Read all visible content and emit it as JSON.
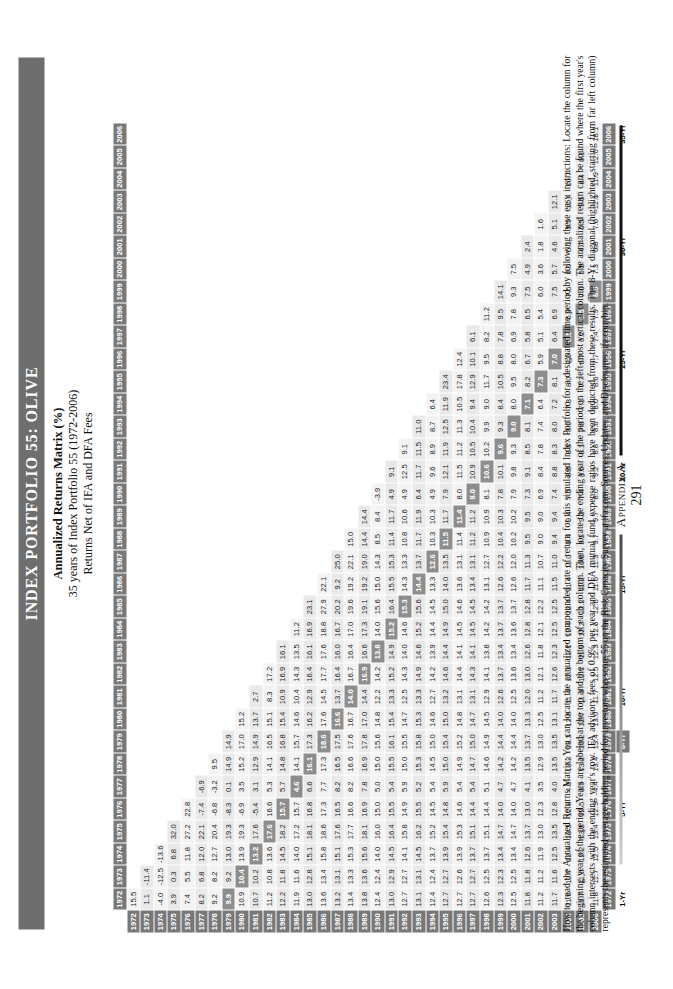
{
  "page": {
    "title": "Index Portfolio 55: Olive",
    "subtitle_1": "Annualized Returns Matrix (%)",
    "subtitle_2": "35 years of Index Portfolio 55 (1972-2006)",
    "subtitle_3": "Returns Net of IFA and DFA Fees",
    "appendix_label": "Appendix A",
    "page_number": "291",
    "caption": "How to read the Annualized Returns Matrix: You can locate the annualized compounded rate of return for this simulated Index Portfolio for a designated time period by following these easy instructions: Locate the column for the beginning year of the period. Years are labeled at the top and the bottom of each column. Then, locate the ending year of the period on the left-most vertical column. The annualized return can be found where the first year's column intersects with the ending year's row. IFA advisory fees of 0.9% per year and DFA mutual fund expense ratios have been deducted from these results. The 8-Yr diagonal (highlighted, starting from far left column) represents the estimated average holding period for investors who score 55 on the Risk Capacity Survey at ifa.com. Sources, Updates, and Disclosures: ifa.com/bip.",
    "colors": {
      "band": "#6e6e6e",
      "header": "#787878",
      "diagonal": "#8d8d8d",
      "cell": "#f3f3f3"
    }
  },
  "chart_data": {
    "type": "table",
    "title": "Annualized Returns Matrix (%)",
    "xlabel": "Beginning Year",
    "ylabel": "Ending Year",
    "columns": [
      "1972",
      "1973",
      "1974",
      "1975",
      "1976",
      "1977",
      "1978",
      "1979",
      "1980",
      "1981",
      "1982",
      "1983",
      "1984",
      "1985",
      "1986",
      "1987",
      "1988",
      "1989",
      "1990",
      "1991",
      "1992",
      "1993",
      "1994",
      "1995",
      "1996",
      "1997",
      "1998",
      "1999",
      "2000",
      "2001",
      "2002",
      "2003",
      "2004",
      "2005",
      "2006"
    ],
    "row_labels": [
      "1972",
      "1973",
      "1974",
      "1975",
      "1976",
      "1977",
      "1978",
      "1979",
      "1980",
      "1981",
      "1982",
      "1983",
      "1984",
      "1985",
      "1986",
      "1987",
      "1988",
      "1989",
      "1990",
      "1991",
      "1992",
      "1993",
      "1994",
      "1995",
      "1996",
      "1997",
      "1998",
      "1999",
      "2000",
      "2001",
      "2002",
      "2003",
      "2004",
      "2005",
      "2006"
    ],
    "period_markers": [
      {
        "row": "1972",
        "label": "1-Yr",
        "highlight": false
      },
      {
        "row": "1976",
        "label": "5-Yr",
        "highlight": false
      },
      {
        "row": "1979",
        "label": "8-Yr",
        "highlight": true
      },
      {
        "row": "1981",
        "label": "10-Yr",
        "highlight": false
      },
      {
        "row": "1986",
        "label": "15-Yr",
        "highlight": false
      },
      {
        "row": "1991",
        "label": "20-Yr",
        "highlight": false
      },
      {
        "row": "1996",
        "label": "25-Yr",
        "highlight": false
      },
      {
        "row": "2001",
        "label": "30-Yr",
        "highlight": false
      },
      {
        "row": "2006",
        "label": "35-Yr",
        "highlight": false
      }
    ],
    "diagonal_offset": 7,
    "rows": [
      [
        "15.5"
      ],
      [
        "1.1",
        "-11.4"
      ],
      [
        "-4.0",
        "-12.5",
        "-13.6"
      ],
      [
        "3.9",
        "0.3",
        "6.8",
        "32.0"
      ],
      [
        "7.4",
        "5.5",
        "11.8",
        "27.2",
        "22.8"
      ],
      [
        "8.2",
        "6.8",
        "12.0",
        "22.1",
        "-7.4",
        "-6.9"
      ],
      [
        "9.2",
        "8.2",
        "12.7",
        "20.4",
        "-6.8",
        "-3.2",
        "9.5"
      ],
      [
        "9.9",
        "9.2",
        "13.0",
        "19.3",
        "-8.3",
        "0.1",
        "14.9",
        "14.9"
      ],
      [
        "10.9",
        "10.4",
        "13.9",
        "19.3",
        "-6.9",
        "3.5",
        "15.2",
        "17.0",
        "15.2"
      ],
      [
        "10.7",
        "10.2",
        "13.2",
        "17.6",
        "-5.4",
        "3.1",
        "12.9",
        "14.9",
        "13.7",
        "2.7"
      ],
      [
        "11.2",
        "10.8",
        "13.6",
        "17.6",
        "16.6",
        "5.3",
        "14.1",
        "16.5",
        "15.1",
        "8.3",
        "17.2"
      ],
      [
        "12.2",
        "11.8",
        "14.5",
        "18.2",
        "15.7",
        "5.7",
        "14.8",
        "16.8",
        "15.4",
        "10.9",
        "16.9",
        "16.1"
      ],
      [
        "11.9",
        "11.6",
        "14.0",
        "17.2",
        "15.7",
        "4.6",
        "14.1",
        "15.7",
        "14.6",
        "10.4",
        "14.3",
        "13.5",
        "11.2"
      ],
      [
        "13.0",
        "12.8",
        "15.1",
        "18.1",
        "16.8",
        "6.6",
        "16.1",
        "17.3",
        "16.2",
        "12.9",
        "16.4",
        "16.1",
        "16.9",
        "23.1"
      ],
      [
        "13.6",
        "13.4",
        "15.8",
        "18.6",
        "17.3",
        "7.7",
        "17.3",
        "18.6",
        "17.6",
        "14.5",
        "17.7",
        "17.6",
        "18.8",
        "27.9",
        "22.1"
      ],
      [
        "13.2",
        "13.1",
        "15.1",
        "17.6",
        "16.5",
        "8.2",
        "16.5",
        "17.5",
        "16.6",
        "13.7",
        "16.4",
        "16.0",
        "16.7",
        "20.2",
        "9.2",
        "25.0"
      ],
      [
        "13.4",
        "13.3",
        "15.3",
        "17.7",
        "16.6",
        "8.2",
        "16.6",
        "17.6",
        "16.7",
        "14.0",
        "16.7",
        "16.4",
        "17.0",
        "19.6",
        "19.2",
        "22.1",
        "15.0"
      ],
      [
        "13.8",
        "13.6",
        "15.6",
        "18.1",
        "16.9",
        "7.8",
        "16.9",
        "17.8",
        "17.0",
        "14.4",
        "16.9",
        "16.6",
        "17.3",
        "19.1",
        "19.2",
        "19.0",
        "14.4",
        "14.4"
      ],
      [
        "12.4",
        "12.4",
        "14.0",
        "16.0",
        "15.0",
        "5.0",
        "15.0",
        "15.6",
        "14.8",
        "12.2",
        "14.2",
        "13.8",
        "14.0",
        "15.6",
        "15.0",
        "14.3",
        "8.5",
        "8.4",
        "-3.9"
      ],
      [
        "13.0",
        "12.9",
        "14.5",
        "16.4",
        "15.5",
        "5.4",
        "15.5",
        "16.1",
        "15.4",
        "13.3",
        "15.2",
        "14.9",
        "15.2",
        "16.4",
        "15.5",
        "15.3",
        "11.4",
        "11.7",
        "4.9",
        "9.1"
      ],
      [
        "12.7",
        "12.7",
        "14.1",
        "15.8",
        "14.9",
        "5.9",
        "15.0",
        "15.5",
        "14.7",
        "12.5",
        "14.3",
        "14.0",
        "14.6",
        "15.3",
        "14.3",
        "13.3",
        "10.8",
        "10.6",
        "4.9",
        "12.5",
        "9.1"
      ],
      [
        "13.1",
        "13.1",
        "14.5",
        "16.2",
        "15.5",
        "5.2",
        "15.3",
        "15.8",
        "15.3",
        "13.3",
        "14.9",
        "14.6",
        "15.2",
        "15.6",
        "14.4",
        "13.7",
        "11.7",
        "11.9",
        "6.4",
        "11.7",
        "11.5",
        "11.0"
      ],
      [
        "12.4",
        "12.4",
        "13.7",
        "15.2",
        "14.5",
        "5.4",
        "14.5",
        "15.0",
        "14.6",
        "12.7",
        "14.2",
        "13.9",
        "14.4",
        "14.5",
        "13.3",
        "12.6",
        "10.3",
        "10.3",
        "4.9",
        "9.6",
        "8.9",
        "8.7",
        "6.4"
      ],
      [
        "12.7",
        "12.7",
        "13.9",
        "15.4",
        "14.8",
        "5.9",
        "15.0",
        "15.4",
        "15.0",
        "13.2",
        "14.6",
        "14.4",
        "14.9",
        "15.0",
        "14.0",
        "13.5",
        "11.5",
        "11.7",
        "7.9",
        "12.1",
        "11.9",
        "12.5",
        "11.9",
        "23.4"
      ],
      [
        "12.7",
        "12.6",
        "13.9",
        "15.3",
        "14.6",
        "5.4",
        "14.9",
        "15.2",
        "14.8",
        "13.1",
        "14.4",
        "14.1",
        "14.5",
        "14.6",
        "13.6",
        "13.1",
        "11.4",
        "11.4",
        "8.0",
        "11.5",
        "11.2",
        "11.3",
        "10.5",
        "17.8",
        "12.4"
      ],
      [
        "12.7",
        "12.7",
        "13.7",
        "15.1",
        "14.4",
        "5.4",
        "14.7",
        "15.0",
        "14.7",
        "13.1",
        "14.3",
        "14.1",
        "14.5",
        "14.5",
        "13.4",
        "13.1",
        "11.2",
        "11.2",
        "8.0",
        "10.9",
        "10.5",
        "10.4",
        "9.4",
        "12.9",
        "10.1",
        "6.1"
      ],
      [
        "12.6",
        "12.5",
        "13.7",
        "15.1",
        "14.4",
        "5.1",
        "14.6",
        "14.9",
        "14.5",
        "12.9",
        "14.1",
        "13.8",
        "14.2",
        "14.2",
        "13.1",
        "12.7",
        "10.9",
        "10.9",
        "8.1",
        "10.6",
        "10.2",
        "9.9",
        "9.0",
        "11.7",
        "9.5",
        "8.2",
        "11.2"
      ],
      [
        "12.3",
        "12.3",
        "13.4",
        "14.7",
        "14.0",
        "4.7",
        "14.2",
        "14.4",
        "14.0",
        "12.6",
        "13.7",
        "13.4",
        "13.7",
        "13.7",
        "12.6",
        "12.2",
        "10.4",
        "10.3",
        "7.8",
        "10.1",
        "9.6",
        "9.3",
        "8.4",
        "10.5",
        "8.8",
        "7.8",
        "9.5",
        "14.1"
      ],
      [
        "12.5",
        "12.5",
        "13.4",
        "14.7",
        "14.0",
        "4.7",
        "14.2",
        "14.4",
        "14.0",
        "12.5",
        "13.6",
        "13.4",
        "13.6",
        "13.7",
        "12.6",
        "12.0",
        "10.2",
        "10.2",
        "7.9",
        "9.8",
        "9.3",
        "9.0",
        "8.0",
        "9.5",
        "8.0",
        "6.9",
        "7.8",
        "9.3",
        "7.5"
      ],
      [
        "11.8",
        "11.8",
        "12.6",
        "13.7",
        "13.0",
        "4.1",
        "13.5",
        "13.7",
        "13.3",
        "12.0",
        "13.0",
        "12.6",
        "12.8",
        "12.8",
        "11.7",
        "11.3",
        "9.5",
        "9.5",
        "7.3",
        "9.1",
        "8.5",
        "8.1",
        "7.1",
        "8.2",
        "6.7",
        "5.8",
        "6.5",
        "7.5",
        "4.9",
        "2.4"
      ],
      [
        "11.2",
        "11.2",
        "11.9",
        "13.0",
        "12.3",
        "3.5",
        "12.9",
        "13.0",
        "12.5",
        "11.2",
        "12.1",
        "11.8",
        "12.1",
        "12.2",
        "11.1",
        "10.7",
        "9.0",
        "9.0",
        "6.9",
        "8.4",
        "7.8",
        "7.4",
        "6.4",
        "7.3",
        "5.9",
        "5.1",
        "5.4",
        "6.0",
        "3.6",
        "1.8",
        "1.6"
      ],
      [
        "11.7",
        "11.6",
        "12.5",
        "13.5",
        "12.8",
        "4.0",
        "13.5",
        "13.5",
        "13.1",
        "11.7",
        "12.6",
        "12.3",
        "12.5",
        "12.5",
        "11.5",
        "11.0",
        "9.4",
        "9.4",
        "7.4",
        "8.8",
        "8.3",
        "8.0",
        "7.2",
        "8.1",
        "7.0",
        "6.4",
        "6.9",
        "7.5",
        "5.7",
        "4.6",
        "5.1",
        "12.1"
      ],
      [
        "11.8",
        "11.7",
        "12.4",
        "13.3",
        "12.8",
        "4.0",
        "13.3",
        "13.3",
        "12.8",
        "11.4",
        "12.3",
        "12.1",
        "12.4",
        "12.4",
        "11.4",
        "11.0",
        "9.4",
        "9.4",
        "7.5",
        "8.8",
        "8.3",
        "8.0",
        "7.3",
        "8.0",
        "7.0",
        "6.5",
        "6.9",
        "7.5",
        "6.0",
        "5.1",
        "5.9",
        "11.4",
        "10.7"
      ],
      [
        "11.7",
        "11.6",
        "12.2",
        "13.2",
        "12.5",
        "3.9",
        "13.2",
        "13.2",
        "12.7",
        "11.3",
        "12.1",
        "11.9",
        "12.2",
        "12.2",
        "11.2",
        "10.8",
        "9.2",
        "9.2",
        "7.4",
        "8.6",
        "8.1",
        "7.8",
        "7.1",
        "7.7",
        "6.7",
        "6.2",
        "6.5",
        "7.0",
        "5.5",
        "4.7",
        "5.3",
        "9.5",
        "8.4",
        "6.1"
      ],
      [
        "11.8",
        "11.7",
        "12.5",
        "13.4",
        "12.9",
        "4.4",
        "13.4",
        "13.4",
        "13.0",
        "11.7",
        "12.5",
        "12.3",
        "12.6",
        "12.6",
        "11.6",
        "11.3",
        "9.7",
        "9.7",
        "8.0",
        "9.2",
        "8.8",
        "8.6",
        "8.0",
        "8.6",
        "7.7",
        "7.4",
        "7.9",
        "8.5",
        "7.3",
        "6.8",
        "7.6",
        "12.1",
        "11.9",
        "12.0",
        "18.1"
      ]
    ]
  }
}
